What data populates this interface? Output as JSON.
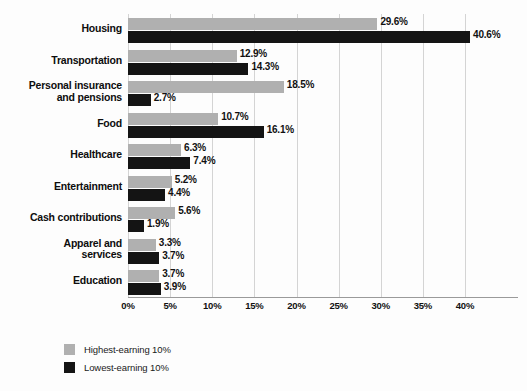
{
  "chart_data": {
    "type": "bar",
    "orientation": "horizontal",
    "title": "",
    "xlabel": "",
    "ylabel": "",
    "xlim": [
      0,
      40
    ],
    "grid": true,
    "legend_position": "bottom-left",
    "xtick_labels": [
      "0%",
      "5%",
      "10%",
      "15%",
      "20%",
      "25%",
      "30%",
      "35%",
      "40%"
    ],
    "xtick_values": [
      0,
      5,
      10,
      15,
      20,
      25,
      30,
      35,
      40
    ],
    "categories": [
      "Housing",
      "Transportation",
      "Personal insurance and pensions",
      "Food",
      "Healthcare",
      "Entertainment",
      "Cash contributions",
      "Apparel and services",
      "Education"
    ],
    "category_lines": [
      [
        "Housing"
      ],
      [
        "Transportation"
      ],
      [
        "Personal insurance",
        "and pensions"
      ],
      [
        "Food"
      ],
      [
        "Healthcare"
      ],
      [
        "Entertainment"
      ],
      [
        "Cash contributions"
      ],
      [
        "Apparel and",
        "services"
      ],
      [
        "Education"
      ]
    ],
    "series": [
      {
        "name": "Highest-earning 10%",
        "color": "#b0b0b0",
        "values": [
          29.6,
          12.9,
          18.5,
          10.7,
          6.3,
          5.2,
          5.6,
          3.3,
          3.7
        ],
        "labels": [
          "29.6%",
          "12.9%",
          "18.5%",
          "10.7%",
          "6.3%",
          "5.2%",
          "5.6%",
          "3.3%",
          "3.7%"
        ]
      },
      {
        "name": "Lowest-earning 10%",
        "color": "#141414",
        "values": [
          40.6,
          14.3,
          2.7,
          16.1,
          7.4,
          4.4,
          1.9,
          3.7,
          3.9
        ],
        "labels": [
          "40.6%",
          "14.3%",
          "2.7%",
          "16.1%",
          "7.4%",
          "4.4%",
          "1.9%",
          "3.7%",
          "3.9%"
        ]
      }
    ]
  },
  "legend": {
    "items": [
      {
        "label": "Highest-earning 10%",
        "color": "#b0b0b0"
      },
      {
        "label": "Lowest-earning 10%",
        "color": "#141414"
      }
    ]
  }
}
